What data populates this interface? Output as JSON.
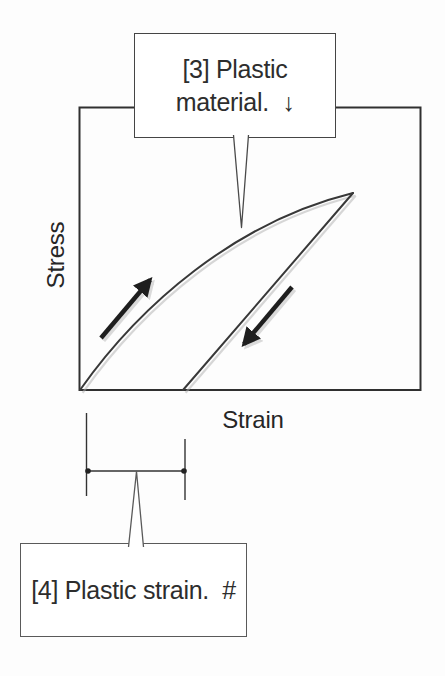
{
  "figure": {
    "axes": {
      "y_label": "Stress",
      "x_label": "Strain"
    },
    "callouts": {
      "plastic_material": {
        "line1": "[3] Plastic",
        "line2": "material.  ↓"
      },
      "plastic_strain": {
        "text": "[4] Plastic strain.  #"
      }
    },
    "icons": {
      "loading_arrow": "up-right-arrow",
      "unloading_arrow": "down-left-arrow",
      "down_arrow_glyph": "↓",
      "hash_glyph": "#"
    },
    "colors": {
      "background": "#fdfdfd",
      "curve_line": "#383838",
      "plot_frame": "#303030",
      "arrow": "#1e1e1e",
      "callout_border": "#454545",
      "shadow": "#b0b0b0",
      "text": "#2d2d2d"
    }
  }
}
